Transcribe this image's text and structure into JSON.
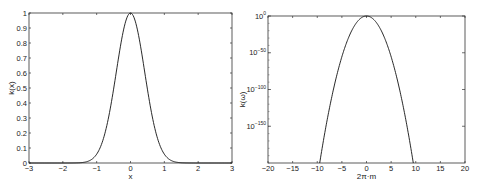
{
  "chart_data": [
    {
      "type": "line",
      "title": "",
      "xlabel": "x",
      "ylabel": "k(x)",
      "xlim": [
        -3,
        3
      ],
      "ylim": [
        0,
        1
      ],
      "grid": false,
      "x_ticks": [
        "-3",
        "-2",
        "-1",
        "0",
        "1",
        "2",
        "3"
      ],
      "y_ticks": [
        "0",
        "0.1",
        "0.2",
        "0.3",
        "0.4",
        "0.5",
        "0.6",
        "0.7",
        "0.8",
        "0.9",
        "1"
      ],
      "series": [
        {
          "name": "k(x)",
          "x": [
            -3,
            -2,
            -1.75,
            -1.5,
            -1.25,
            -1,
            -0.75,
            -0.5,
            -0.25,
            0,
            0.25,
            0.5,
            0.75,
            1,
            1.25,
            1.5,
            1.75,
            2,
            3
          ],
          "values": [
            0,
            0,
            0.002,
            0.02,
            0.06,
            0.15,
            0.33,
            0.58,
            0.86,
            1.0,
            0.86,
            0.58,
            0.33,
            0.15,
            0.06,
            0.02,
            0.002,
            0,
            0
          ]
        }
      ]
    },
    {
      "type": "line",
      "title": "",
      "xlabel": "2π·m",
      "ylabel": "k(ω)",
      "xlim": [
        -20,
        20
      ],
      "yscale": "log",
      "ylim_exponent": [
        -200,
        0
      ],
      "grid": false,
      "x_ticks": [
        "-20",
        "-15",
        "-10",
        "-5",
        "0",
        "5",
        "10",
        "15",
        "20"
      ],
      "y_ticks": [
        {
          "base": "10",
          "exp": "0"
        },
        {
          "base": "10",
          "exp": "-50"
        },
        {
          "base": "10",
          "exp": "-100"
        },
        {
          "base": "10",
          "exp": "-150"
        }
      ],
      "series": [
        {
          "name": "k(ω)",
          "x": [
            -9.5,
            -8,
            -6,
            -4,
            -2,
            0,
            2,
            4,
            6,
            8,
            9.5
          ],
          "log10_values": [
            -200,
            -145,
            -82,
            -37,
            -9,
            0,
            -9,
            -37,
            -82,
            -145,
            -200
          ]
        }
      ]
    }
  ]
}
